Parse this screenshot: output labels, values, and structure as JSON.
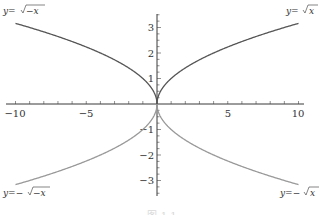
{
  "chart_data": {
    "type": "line",
    "title": "",
    "xlabel": "",
    "ylabel": "",
    "xlim": [
      -10,
      10
    ],
    "ylim": [
      -3.5,
      3.5
    ],
    "grid": false,
    "legend": "none (inline curve labels)",
    "x_ticks": [
      -10,
      -5,
      5,
      10
    ],
    "y_ticks": [
      -3,
      -2,
      -1,
      1,
      2,
      3
    ],
    "x_tick_labels": [
      "−10",
      "−5",
      "5",
      "10"
    ],
    "y_tick_labels": [
      "−3",
      "−2",
      "−1",
      "1",
      "2",
      "3"
    ],
    "series": [
      {
        "name": "y=√x",
        "label": "y=√x",
        "domain": [
          0,
          10
        ],
        "color": "#555555",
        "x": [
          0,
          1,
          2.5,
          5,
          7.5,
          10
        ],
        "values": [
          0,
          1,
          1.58,
          2.24,
          2.74,
          3.16
        ]
      },
      {
        "name": "y=√−x",
        "label": "y=√−x",
        "domain": [
          -10,
          0
        ],
        "color": "#555555",
        "x": [
          -10,
          -7.5,
          -5,
          -2.5,
          -1,
          0
        ],
        "values": [
          3.16,
          2.74,
          2.24,
          1.58,
          1,
          0
        ]
      },
      {
        "name": "y=−√x",
        "label": "y=−√x",
        "domain": [
          0,
          10
        ],
        "color": "#999999",
        "x": [
          0,
          1,
          2.5,
          5,
          7.5,
          10
        ],
        "values": [
          0,
          -1,
          -1.58,
          -2.24,
          -2.74,
          -3.16
        ]
      },
      {
        "name": "y=−√−x",
        "label": "y=−√−x",
        "domain": [
          -10,
          0
        ],
        "color": "#999999",
        "x": [
          -10,
          -7.5,
          -5,
          -2.5,
          -1,
          0
        ],
        "values": [
          -3.16,
          -2.74,
          -2.24,
          -1.58,
          -1,
          0
        ]
      }
    ],
    "annotations": [
      "y=√−x (top-left)",
      "y=√x (top-right)",
      "y=−√−x (bottom-left)",
      "y=−√x (bottom-right)"
    ]
  },
  "labels": {
    "top_left": {
      "prefix": "y",
      "eq": "=",
      "root": "−x"
    },
    "top_right": {
      "prefix": "y",
      "eq": "=",
      "root": "x"
    },
    "bottom_left": {
      "prefix": "y",
      "eq": "=−",
      "root": "−x"
    },
    "bottom_right": {
      "prefix": "y",
      "eq": "=−",
      "root": "x"
    }
  },
  "ticks": {
    "x": [
      "−10",
      "−5",
      "5",
      "10"
    ],
    "y": [
      "3",
      "2",
      "1",
      "−1",
      "−2",
      "−3"
    ]
  },
  "caption": "图 1.1"
}
